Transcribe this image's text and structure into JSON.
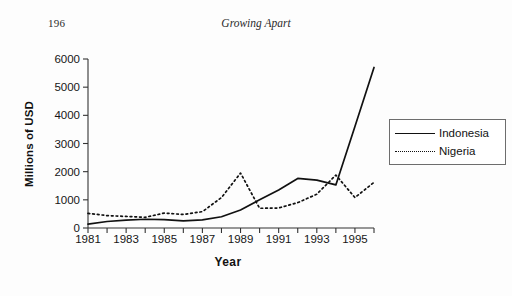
{
  "page": {
    "number": "196",
    "running_head": "Growing Apart"
  },
  "chart_data": {
    "type": "line",
    "title": "",
    "xlabel": "Year",
    "ylabel": "Millions of USD",
    "xlim": [
      1981,
      1996
    ],
    "ylim": [
      0,
      6000
    ],
    "grid": false,
    "legend_position": "right",
    "x": [
      1981,
      1982,
      1983,
      1984,
      1985,
      1986,
      1987,
      1988,
      1989,
      1990,
      1991,
      1992,
      1993,
      1994,
      1995,
      1996
    ],
    "xtick_labels": [
      "1981",
      "1983",
      "1985",
      "1987",
      "1989",
      "1991",
      "1993",
      "1995"
    ],
    "xticks": [
      1981,
      1983,
      1985,
      1987,
      1989,
      1991,
      1993,
      1995
    ],
    "ytick_labels": [
      "0",
      "1000",
      "2000",
      "3000",
      "4000",
      "5000",
      "6000"
    ],
    "yticks": [
      0,
      1000,
      2000,
      3000,
      4000,
      5000,
      6000
    ],
    "series": [
      {
        "name": "Indonesia",
        "style": "solid",
        "color": "#111111",
        "values": [
          140,
          230,
          280,
          310,
          300,
          250,
          290,
          400,
          640,
          1000,
          1350,
          1760,
          1700,
          1530,
          3600,
          5700
        ]
      },
      {
        "name": "Nigeria",
        "style": "dotted",
        "color": "#111111",
        "values": [
          520,
          440,
          410,
          380,
          530,
          480,
          580,
          1080,
          1950,
          700,
          710,
          900,
          1200,
          1880,
          1080,
          1620
        ]
      }
    ]
  },
  "legend": {
    "entries": [
      {
        "label": "Indonesia",
        "style": "solid"
      },
      {
        "label": "Nigeria",
        "style": "dotted"
      }
    ]
  }
}
